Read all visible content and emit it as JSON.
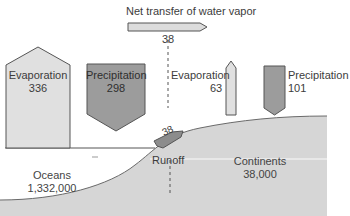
{
  "diagram": {
    "title": "Net transfer of water vapor",
    "net_transfer_value": "38",
    "ocean_evaporation": {
      "label": "Evaporation",
      "value": "336"
    },
    "ocean_precipitation": {
      "label": "Precipitation",
      "value": "298"
    },
    "land_evaporation": {
      "label": "Evaporation",
      "value": "63"
    },
    "land_precipitation": {
      "label": "Precipitation",
      "value": "101"
    },
    "runoff": {
      "label": "Runoff",
      "value": "38"
    },
    "oceans": {
      "label": "Oceans",
      "value": "1,332,000"
    },
    "continents": {
      "label": "Continents",
      "value": "38,000"
    }
  },
  "colors": {
    "light_fill": "#dcdcdc",
    "dark_fill": "#9a9a9a",
    "land_fill": "#d4d4d4",
    "outline": "#555555"
  }
}
